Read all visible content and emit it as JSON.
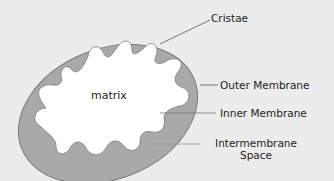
{
  "diagram": {
    "type": "mitochondrion-cross-section",
    "colors": {
      "background": "#ececec",
      "membrane_fill": "#a9a9a9",
      "membrane_stroke": "#7a7a7a",
      "matrix_fill": "#ffffff",
      "leader_line": "#555555",
      "text": "#222222"
    },
    "labels": {
      "matrix": "matrix",
      "cristae": "Cristae",
      "outer_membrane": "Outer Membrane",
      "inner_membrane": "Inner Membrane",
      "intermembrane_line1": "Intermembrane",
      "intermembrane_line2": "Space"
    }
  }
}
